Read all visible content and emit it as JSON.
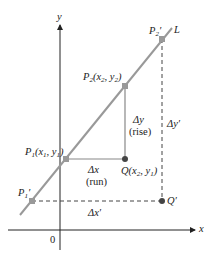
{
  "diagram": {
    "axes": {
      "x_label": "x",
      "y_label": "y",
      "origin_label": "0"
    },
    "line_label": "L",
    "points": {
      "P1": {
        "name": "P",
        "sub": "1",
        "coords_text": "(x",
        "x_sub": "1",
        "sep": ", y",
        "y_sub": "1",
        "close": ")"
      },
      "P2": {
        "name": "P",
        "sub": "2",
        "coords_text": "(x",
        "x_sub": "2",
        "sep": ", y",
        "y_sub": "2",
        "close": ")"
      },
      "Q": {
        "name": "Q",
        "coords_text": "(x",
        "x_sub": "2",
        "sep": ", y",
        "y_sub": "1",
        "close": ")"
      },
      "P1_prime": {
        "name": "P",
        "sub": "1",
        "prime": "′"
      },
      "P2_prime": {
        "name": "P",
        "sub": "2",
        "prime": "′"
      },
      "Q_prime": {
        "name": "Q′"
      }
    },
    "delta_y": {
      "symbol": "Δy",
      "note": "(rise)"
    },
    "delta_x": {
      "symbol": "Δx",
      "note": "(run)"
    },
    "delta_y_prime": "Δy′",
    "delta_x_prime": "Δx′",
    "colors": {
      "line": "#999999",
      "axis": "#222222",
      "point": "#555555"
    }
  }
}
